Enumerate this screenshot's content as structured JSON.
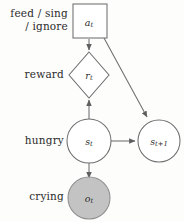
{
  "diagram": {
    "type": "probabilistic-graphical-model",
    "title": "",
    "background_color": "#fdfdfc",
    "stroke_color": "#6e6e6e",
    "shaded_fill_color": "#c3c3c3",
    "row_labels": {
      "action": "feed / sing\n/ ignore",
      "reward": "reward",
      "hungry": "hungry",
      "crying": "crying"
    },
    "nodes": [
      {
        "id": "action",
        "shape": "square",
        "label_base": "a",
        "label_sub": "t",
        "shaded": false,
        "row": "action"
      },
      {
        "id": "reward",
        "shape": "diamond",
        "label_base": "r",
        "label_sub": "t",
        "shaded": false,
        "row": "reward"
      },
      {
        "id": "state-t",
        "shape": "circle",
        "label_base": "s",
        "label_sub": "t",
        "shaded": false,
        "row": "hungry"
      },
      {
        "id": "state-t-plus-1",
        "shape": "circle",
        "label_base": "s",
        "label_sub": "t+1",
        "shaded": false,
        "row": "hungry"
      },
      {
        "id": "observation",
        "shape": "circle",
        "label_base": "o",
        "label_sub": "t",
        "shaded": true,
        "row": "crying"
      }
    ],
    "edges": [
      {
        "from": "action",
        "to": "reward",
        "style": "arrow"
      },
      {
        "from": "action",
        "to": "state-t-plus-1",
        "style": "arrow"
      },
      {
        "from": "state-t",
        "to": "reward",
        "style": "arrow"
      },
      {
        "from": "state-t",
        "to": "state-t-plus-1",
        "style": "arrow"
      },
      {
        "from": "state-t",
        "to": "observation",
        "style": "arrow"
      }
    ]
  }
}
